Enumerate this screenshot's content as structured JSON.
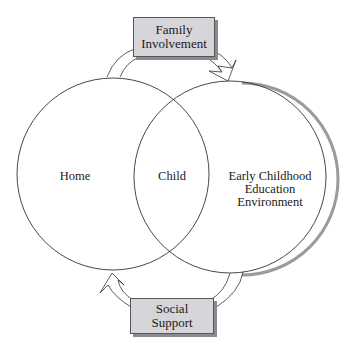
{
  "diagram": {
    "circles": [
      {
        "id": "home",
        "label": "Home"
      },
      {
        "id": "ece",
        "label_lines": [
          "Early Childhood",
          "Education",
          "Environment"
        ]
      }
    ],
    "overlap_label": "Child",
    "top_box": {
      "lines": [
        "Family",
        "Involvement"
      ]
    },
    "bottom_box": {
      "lines": [
        "Social",
        "Support"
      ]
    },
    "colors": {
      "line": "#333333",
      "box_fill": "#d6d6da",
      "box_shadow": "#8a8a92"
    }
  }
}
